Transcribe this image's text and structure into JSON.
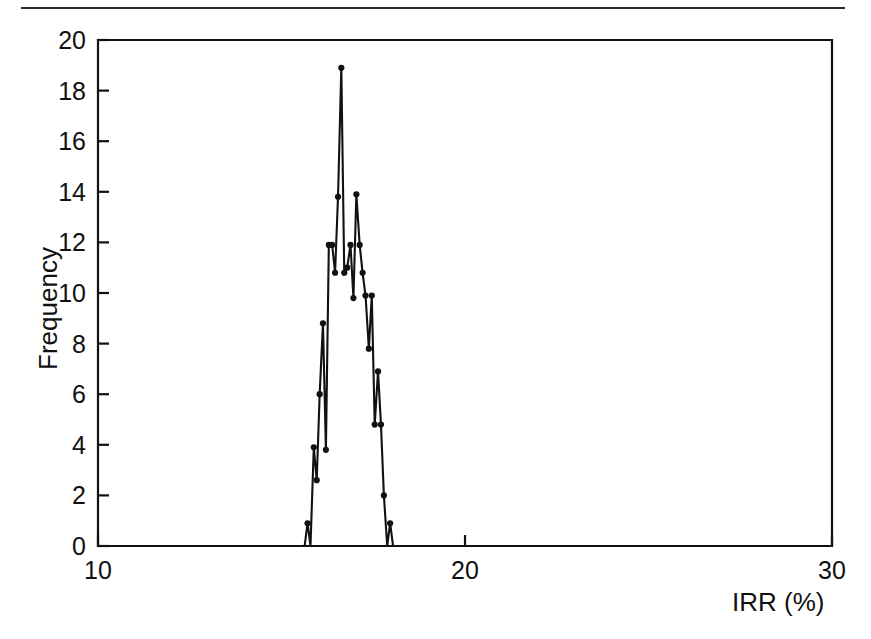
{
  "figure": {
    "background_color": "#ffffff",
    "line_color": "#111111",
    "top_rule": "horizontal-rule"
  },
  "chart_data": {
    "type": "line",
    "title": "",
    "subtitle": "",
    "xlabel": "IRR (%)",
    "ylabel": "Frequency",
    "xlim": [
      10,
      30
    ],
    "ylim": [
      0,
      20
    ],
    "xticks": [
      10,
      20,
      30
    ],
    "xtick_labels": [
      "10",
      "20",
      "30"
    ],
    "yticks": [
      0,
      2,
      4,
      6,
      8,
      10,
      12,
      14,
      16,
      18,
      20
    ],
    "ytick_labels": [
      "0",
      "2",
      "4",
      "6",
      "8",
      "10",
      "12",
      "14",
      "16",
      "18",
      "20"
    ],
    "grid": false,
    "legend": null,
    "legend_position": "none",
    "markers": "filled-circle",
    "annotations": [],
    "series": [
      {
        "name": "IRR frequency distribution",
        "color": "#111111",
        "x": [
          15.63,
          15.71,
          15.79,
          15.88,
          15.96,
          16.04,
          16.13,
          16.21,
          16.29,
          16.38,
          16.46,
          16.54,
          16.63,
          16.71,
          16.79,
          16.88,
          16.96,
          17.04,
          17.13,
          17.21,
          17.29,
          17.38,
          17.46,
          17.54,
          17.63,
          17.71,
          17.79,
          17.88,
          17.96,
          18.04
        ],
        "y": [
          0.0,
          0.9,
          0.0,
          3.9,
          2.6,
          6.0,
          8.8,
          3.8,
          11.9,
          11.9,
          10.8,
          13.8,
          18.9,
          10.8,
          11.0,
          11.9,
          9.8,
          13.9,
          11.9,
          10.8,
          9.9,
          7.8,
          9.9,
          4.8,
          6.9,
          4.8,
          2.0,
          0.0,
          0.9,
          0.0
        ]
      }
    ]
  }
}
